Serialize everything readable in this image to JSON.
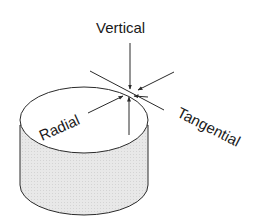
{
  "diagram": {
    "labels": {
      "vertical": "Vertical",
      "radial": "Radial",
      "tangential": "Tangential"
    },
    "colors": {
      "stroke": "#2a2a2a",
      "side_fill": "#e6e6e6",
      "top_fill": "#ffffff",
      "text": "#1a1a1a"
    }
  }
}
